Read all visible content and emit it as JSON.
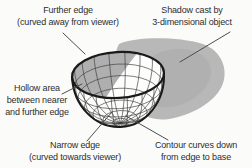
{
  "labels": {
    "further_edge": [
      "Further edge",
      "(curved away from viewer)"
    ],
    "shadow": [
      "Shadow cast by",
      "3-dimensional object"
    ],
    "hollow_area": [
      "Hollow area",
      "between nearer",
      "and further edge"
    ],
    "narrow_edge": [
      "Narrow edge",
      "(curved towards viewer)"
    ],
    "contour": [
      "Contour curves down",
      "from edge to base"
    ]
  },
  "colors": {
    "background": "#fbfbfa",
    "text": "#2e2e2e",
    "shadow_gray": "#b8b8b8",
    "shadow_core": "#a9a9a9",
    "interior_shade": "#afafaf",
    "bowl_white": "#fdfdfc",
    "ink": "#1a1a1a",
    "wire": "#3d3d3d",
    "leader": "#4d4d4d"
  }
}
